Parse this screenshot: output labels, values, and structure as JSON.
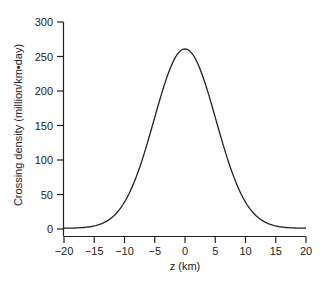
{
  "chart_data": {
    "type": "line",
    "title": "",
    "xlabel": "z (km)",
    "ylabel": "Crossing density (million/km•day)",
    "xlim": [
      -20,
      20
    ],
    "ylim": [
      0,
      300
    ],
    "xticks": [
      -20,
      -15,
      -10,
      -5,
      0,
      5,
      10,
      15,
      20
    ],
    "xtick_labels": [
      "−20",
      "−15",
      "−10",
      "−5",
      "0",
      "5",
      "10",
      "15",
      "20"
    ],
    "yticks": [
      0,
      50,
      100,
      150,
      200,
      250,
      300
    ],
    "ytick_labels": [
      "0",
      "50",
      "100",
      "150",
      "200",
      "250",
      "300"
    ],
    "grid": false,
    "legend": null,
    "series": [
      {
        "name": "Crossing density",
        "color": "#222222",
        "x": [
          -20,
          -18,
          -16,
          -15,
          -14,
          -13,
          -12,
          -11,
          -10,
          -9,
          -8,
          -7,
          -6,
          -5,
          -4,
          -3,
          -2,
          -1,
          0,
          1,
          2,
          3,
          4,
          5,
          6,
          7,
          8,
          9,
          10,
          11,
          12,
          13,
          14,
          15,
          16,
          18,
          20
        ],
        "y": [
          1,
          2,
          4,
          6,
          12,
          20,
          31,
          46,
          38,
          55,
          76,
          101,
          130,
          161,
          192,
          219,
          241,
          255,
          260,
          255,
          241,
          219,
          192,
          161,
          130,
          101,
          76,
          55,
          38,
          25,
          16,
          10,
          6,
          4,
          3,
          2,
          1
        ]
      }
    ]
  }
}
